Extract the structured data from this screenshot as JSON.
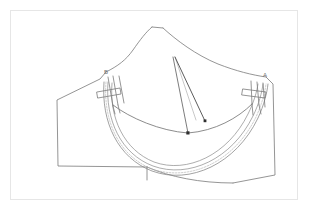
{
  "figure": {
    "type": "patent-style line drawing",
    "background_color": "#ffffff",
    "frame_color": "#e6e6e6",
    "line_color": "#7a7a7a",
    "line_color_dark": "#4a4a4a",
    "accent_gray": "#b5b5b5"
  },
  "labels": [
    {
      "id": "label-a",
      "text": "A",
      "x": 266,
      "y": 76,
      "target": "right-strap-assembly"
    },
    {
      "id": "label-b",
      "text": "B",
      "x": 106,
      "y": 73,
      "target": "left-strap-assembly"
    }
  ],
  "parts": {
    "top_peak": "center-top-peak",
    "left_panel": "left-wing-panel",
    "right_panel": "right-wing-panel",
    "underwire": "double-curve-underwire-seam",
    "stitch": "dashed-stitch-line",
    "dart": "three-line-dart-from-apex",
    "apex": "dart-apex-point",
    "notch": "bottom-edge-notch-tick"
  }
}
